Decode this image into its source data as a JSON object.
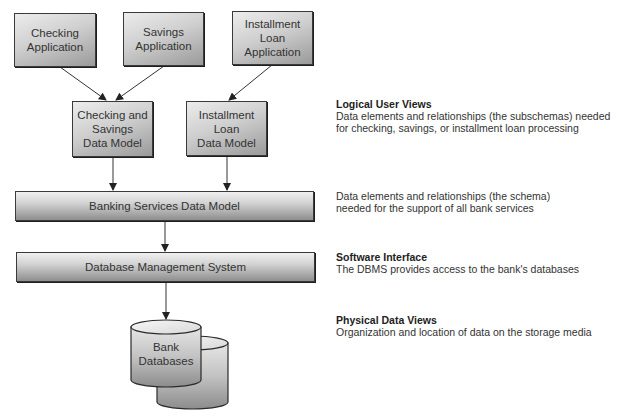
{
  "applications": [
    {
      "label": "Checking\nApplication"
    },
    {
      "label": "Savings\nApplication"
    },
    {
      "label": "Installment\nLoan\nApplication"
    }
  ],
  "data_models": [
    {
      "label": "Checking and\nSavings\nData Model"
    },
    {
      "label": "Installment\nLoan\nData Model"
    }
  ],
  "schema_bar": {
    "label": "Banking Services Data Model"
  },
  "dbms_bar": {
    "label": "Database Management System"
  },
  "database": {
    "label": "Bank\nDatabases"
  },
  "annotations": {
    "logical": {
      "title": "Logical User Views",
      "line1": "Data elements and relationships (the subschemas) needed",
      "line2": "for checking, savings, or installment loan processing"
    },
    "schema": {
      "line1": "Data elements and relationships (the schema)",
      "line2": "needed for the support of all bank services"
    },
    "software": {
      "title": "Software Interface",
      "line1": "The DBMS provides access to the bank's databases"
    },
    "physical": {
      "title": "Physical Data Views",
      "line1": "Organization and location of data on the storage media"
    }
  },
  "colors": {
    "box_border": "#3a3a3a",
    "gradient_light": "#ececec",
    "gradient_dark": "#9a9a9a",
    "text": "#333333"
  }
}
